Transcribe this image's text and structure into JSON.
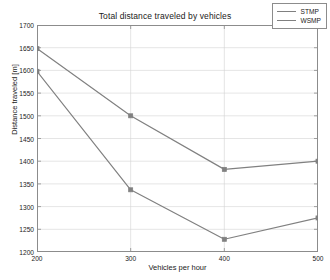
{
  "chart_data": {
    "type": "line",
    "title": "Total distance traveled by vehicles",
    "xlabel": "Vehicles per hour",
    "ylabel": "Distance traveled [m]",
    "x": [
      200,
      300,
      400,
      500
    ],
    "xlim": [
      200,
      500
    ],
    "ylim": [
      1200,
      1700
    ],
    "xticks": [
      "200",
      "300",
      "400",
      "500"
    ],
    "yticks": [
      "1200",
      "1250",
      "1300",
      "1350",
      "1400",
      "1450",
      "1500",
      "1550",
      "1600",
      "1650",
      "1700"
    ],
    "grid": true,
    "legend_position": "top-right",
    "series": [
      {
        "name": "STMP",
        "color": "#808080",
        "marker": "square",
        "values": [
          1648,
          1500,
          1382,
          1400
        ]
      },
      {
        "name": "WSMP",
        "color": "#808080",
        "marker": "square",
        "values": [
          1598,
          1337,
          1228,
          1275
        ]
      }
    ]
  },
  "legend": {
    "entries": [
      "STMP",
      "WSMP"
    ]
  }
}
